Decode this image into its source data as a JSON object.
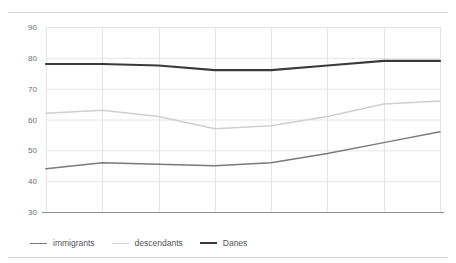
{
  "chart_data": {
    "type": "line",
    "title": "",
    "xlabel": "",
    "ylabel": "",
    "categories": [
      "2001",
      "2002",
      "2003",
      "2004",
      "2005",
      "2006",
      "2007",
      "2008"
    ],
    "x": [
      2001,
      2002,
      2003,
      2004,
      2005,
      2006,
      2007,
      2008
    ],
    "ylim": [
      30,
      90
    ],
    "yticks": [
      30,
      40,
      50,
      60,
      70,
      80,
      90
    ],
    "ytick_labels": [
      "30",
      "40",
      "50",
      "60",
      "70",
      "80",
      "90"
    ],
    "grid": true,
    "legend_position": "bottom-left",
    "series": [
      {
        "name": "immigrants",
        "color": "#7a7a7c",
        "values": [
          44,
          46,
          45.5,
          45,
          46,
          49,
          52.5,
          56
        ]
      },
      {
        "name": "descendants",
        "color": "#cfcfd1",
        "values": [
          62,
          63,
          61,
          57,
          58,
          61,
          65,
          66
        ]
      },
      {
        "name": "Danes",
        "color": "#3a3a3c",
        "values": [
          78,
          78,
          77.5,
          76,
          76,
          77.5,
          79,
          79
        ]
      }
    ]
  },
  "legend": {
    "items": [
      {
        "label": "immigrants",
        "color": "#7a7a7c"
      },
      {
        "label": "descendants",
        "color": "#cfcfd1"
      },
      {
        "label": "Danes",
        "color": "#3a3a3c"
      }
    ]
  },
  "axes": {
    "y_labels": [
      "90",
      "80",
      "70",
      "60",
      "50",
      "40",
      "30"
    ],
    "x_labels": [
      "2001",
      "2002",
      "2003",
      "2004",
      "2005",
      "2006",
      "2007",
      "2008"
    ]
  },
  "colors": {
    "grid": "#e6e6e8",
    "axis": "#8f8f91",
    "rule": "#d2d2d4",
    "text": "#6d6d6f"
  }
}
